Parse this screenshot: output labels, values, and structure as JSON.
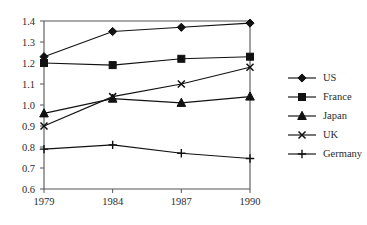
{
  "chart_data": {
    "type": "line",
    "title": "",
    "xlabel": "",
    "ylabel": "",
    "categories": [
      "1979",
      "1984",
      "1987",
      "1990"
    ],
    "x": [
      1979,
      1984,
      1987,
      1990
    ],
    "ylim": [
      0.6,
      1.4
    ],
    "yticks": [
      "0.6",
      "0.7",
      "0.8",
      "0.9",
      "1.0",
      "1.1",
      "1.2",
      "1.3",
      "1.4"
    ],
    "ytick_values": [
      0.6,
      0.7,
      0.8,
      0.9,
      1.0,
      1.1,
      1.2,
      1.3,
      1.4
    ],
    "grid": false,
    "legend_position": "right",
    "series": [
      {
        "name": "US",
        "marker": "diamond",
        "values": [
          1.23,
          1.35,
          1.37,
          1.39
        ]
      },
      {
        "name": "France",
        "marker": "square",
        "values": [
          1.2,
          1.19,
          1.22,
          1.23
        ]
      },
      {
        "name": "Japan",
        "marker": "triangle",
        "values": [
          0.96,
          1.03,
          1.01,
          1.04
        ]
      },
      {
        "name": "UK",
        "marker": "x",
        "values": [
          0.9,
          1.04,
          1.1,
          1.18
        ]
      },
      {
        "name": "Germany",
        "marker": "plus",
        "values": [
          0.79,
          0.81,
          0.77,
          0.745
        ]
      }
    ]
  },
  "legend": {
    "entries": [
      {
        "label": "US",
        "marker": "diamond"
      },
      {
        "label": "France",
        "marker": "square"
      },
      {
        "label": "Japan",
        "marker": "triangle"
      },
      {
        "label": "UK",
        "marker": "x"
      },
      {
        "label": "Germany",
        "marker": "plus"
      }
    ]
  }
}
